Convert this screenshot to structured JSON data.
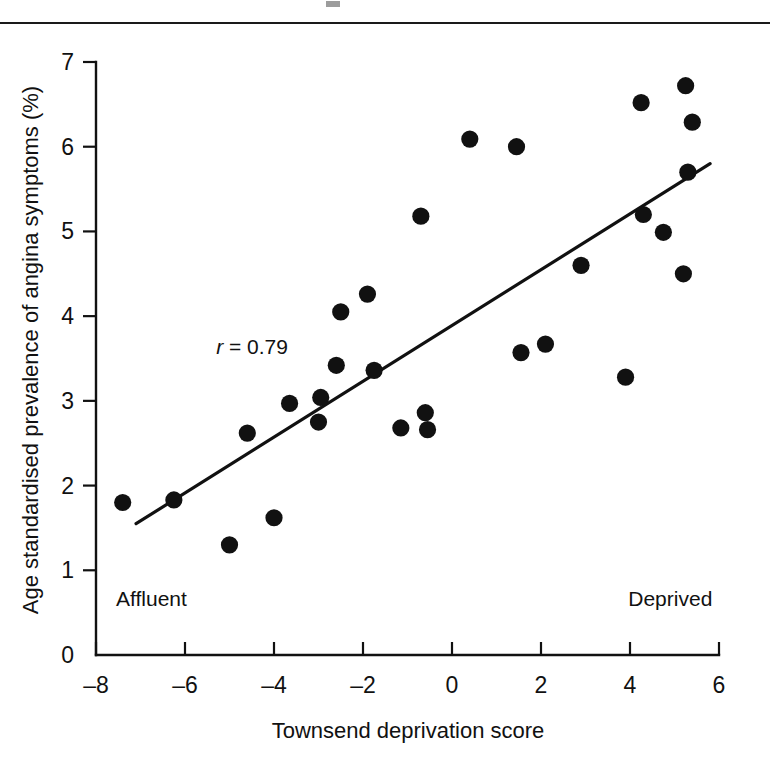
{
  "figure": {
    "background_color": "#ffffff",
    "ink_color": "#111111",
    "top_rule": true
  },
  "chart_data": {
    "type": "scatter",
    "title": "",
    "xlabel": "Townsend deprivation score",
    "ylabel": "Age standardised prevalence of angina symptoms (%)",
    "xlim": [
      -8,
      6
    ],
    "ylim": [
      0,
      7
    ],
    "xticks": [
      -8,
      -6,
      -4,
      -2,
      0,
      2,
      4,
      6
    ],
    "xtick_labels": [
      "–8",
      "–6",
      "–4",
      "–2",
      "0",
      "2",
      "4",
      "6"
    ],
    "yticks": [
      0,
      1,
      2,
      3,
      4,
      5,
      6,
      7
    ],
    "ytick_labels": [
      "0",
      "1",
      "2",
      "3",
      "4",
      "5",
      "6",
      "7"
    ],
    "grid": false,
    "legend": false,
    "marker": "filled-circle",
    "marker_color": "#111111",
    "points": [
      {
        "x": -7.4,
        "y": 1.8
      },
      {
        "x": -6.25,
        "y": 1.83
      },
      {
        "x": -5.0,
        "y": 1.3
      },
      {
        "x": -4.6,
        "y": 2.62
      },
      {
        "x": -4.0,
        "y": 1.62
      },
      {
        "x": -3.65,
        "y": 2.97
      },
      {
        "x": -3.0,
        "y": 2.75
      },
      {
        "x": -2.95,
        "y": 3.04
      },
      {
        "x": -2.6,
        "y": 3.42
      },
      {
        "x": -2.5,
        "y": 4.05
      },
      {
        "x": -1.9,
        "y": 4.26
      },
      {
        "x": -1.75,
        "y": 3.36
      },
      {
        "x": -1.15,
        "y": 2.68
      },
      {
        "x": -0.7,
        "y": 5.18
      },
      {
        "x": -0.6,
        "y": 2.86
      },
      {
        "x": -0.55,
        "y": 2.66
      },
      {
        "x": 0.4,
        "y": 6.09
      },
      {
        "x": 1.45,
        "y": 6.0
      },
      {
        "x": 1.55,
        "y": 3.57
      },
      {
        "x": 2.1,
        "y": 3.67
      },
      {
        "x": 2.9,
        "y": 4.6
      },
      {
        "x": 3.9,
        "y": 3.28
      },
      {
        "x": 4.25,
        "y": 6.52
      },
      {
        "x": 4.3,
        "y": 5.2
      },
      {
        "x": 4.75,
        "y": 4.99
      },
      {
        "x": 5.2,
        "y": 4.5
      },
      {
        "x": 5.25,
        "y": 6.72
      },
      {
        "x": 5.3,
        "y": 5.7
      },
      {
        "x": 5.4,
        "y": 6.29
      }
    ],
    "fit_line": {
      "label": "regression line",
      "x_start": -7.1,
      "y_start": 1.55,
      "x_end": 5.8,
      "y_end": 5.8
    },
    "annotations": [
      {
        "name": "correlation",
        "italic_part": "r",
        "rest": " = 0.79",
        "x": -5.3,
        "y": 3.55
      },
      {
        "name": "affluent-label",
        "text": "Affluent",
        "x": -7.55,
        "y": 0.58
      },
      {
        "name": "deprived-label",
        "text": "Deprived",
        "x": 5.85,
        "y": 0.58
      }
    ]
  }
}
